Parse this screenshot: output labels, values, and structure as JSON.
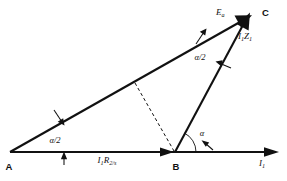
{
  "figure": {
    "background_color": "#ffffff",
    "line_color": "#111111"
  },
  "vertices": [
    {
      "id": "A",
      "label": "A",
      "x": 10,
      "y": 152
    },
    {
      "id": "B",
      "label": "B",
      "x": 175,
      "y": 152
    },
    {
      "id": "C",
      "label": "C",
      "x": 255,
      "y": 12
    }
  ],
  "vectors": [
    {
      "id": "E_a",
      "from": "A",
      "to": "C",
      "label_main": "E",
      "label_sub": "a",
      "label_x": 216,
      "label_y": 14
    },
    {
      "id": "I1Z1",
      "from": "B",
      "to": "C",
      "label_main": "I",
      "label_sub": "1",
      "label_main2": "Z",
      "label_sub2": "1",
      "label_x": 238,
      "label_y": 36
    },
    {
      "id": "I1R2s",
      "from": "A",
      "to": "B",
      "label_main": "I",
      "label_sub": "1",
      "label_main2": "R",
      "label_sub2": "2",
      "label_tail": "/s",
      "label_x": 107,
      "label_y": 160
    }
  ],
  "axis": {
    "id": "current-axis",
    "label_main": "I",
    "label_sub": "1",
    "label_x": 259,
    "label_y": 162,
    "from_x": 10,
    "to_x": 278,
    "y": 152
  },
  "angles": [
    {
      "id": "alpha-half-at-A",
      "label": "α/2",
      "x": 55,
      "y": 140
    },
    {
      "id": "alpha-half-at-C",
      "label": "α/2",
      "x": 200,
      "y": 57
    },
    {
      "id": "alpha-at-B",
      "label": "α",
      "x": 202,
      "y": 133
    }
  ],
  "marks": [
    {
      "id": "tick-on-AC-lower",
      "kind": "arrow-tick"
    },
    {
      "id": "tick-on-AC-upper",
      "kind": "arrow-tick"
    },
    {
      "id": "tick-on-BC",
      "kind": "arrow-tick"
    },
    {
      "id": "tick-below-axis",
      "kind": "arrow-tick"
    },
    {
      "id": "tick-on-alpha-arc",
      "kind": "arrow-tick"
    }
  ],
  "construction": {
    "id": "dashed-altitude",
    "from_x": 135,
    "from_y": 83,
    "to_x": 175,
    "to_y": 152
  }
}
